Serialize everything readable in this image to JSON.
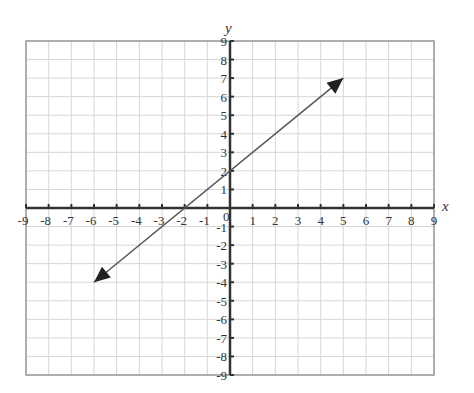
{
  "chart_data": {
    "type": "line",
    "title": "",
    "xlabel": "x",
    "ylabel": "y",
    "xlim": [
      -9,
      9
    ],
    "ylim": [
      -9,
      9
    ],
    "grid": true,
    "x_ticks": [
      -9,
      -8,
      -7,
      -6,
      -5,
      -4,
      -3,
      -2,
      -1,
      1,
      2,
      3,
      4,
      5,
      6,
      7,
      8,
      9
    ],
    "y_ticks": [
      9,
      8,
      7,
      6,
      5,
      4,
      3,
      2,
      1,
      -1,
      -2,
      -3,
      -4,
      -5,
      -6,
      -7,
      -8,
      -9
    ],
    "origin_label": "0",
    "series": [
      {
        "name": "line",
        "equation": "y = x + 2",
        "arrows_both_ends": true,
        "x": [
          -6,
          5
        ],
        "y": [
          -4,
          7
        ]
      }
    ]
  },
  "colors": {
    "grid": "#d6d6d6",
    "frame": "#9a9a9a",
    "axis": "#333333",
    "line": "#555555",
    "arrowhead": "#222222"
  }
}
